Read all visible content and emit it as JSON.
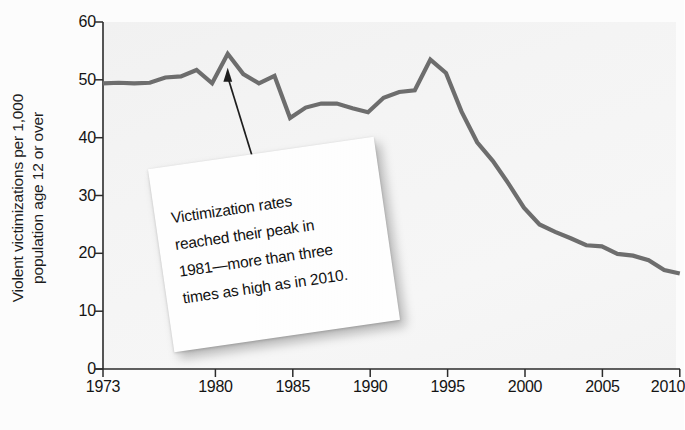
{
  "chart_data": {
    "type": "line",
    "title": "",
    "xlabel": "",
    "ylabel": "Violent victimizations per 1,000 population age 12 or over",
    "ylabel_line1": "Violent victimizations per 1,000",
    "ylabel_line2": "population age 12 or over",
    "xlim": [
      1973,
      2010
    ],
    "ylim": [
      0,
      60
    ],
    "grid": false,
    "legend": null,
    "line_color": "#6e6e6e",
    "x_ticks": [
      "1973",
      "1980",
      "1985",
      "1990",
      "1995",
      "2000",
      "2005",
      "2010"
    ],
    "x_tick_values": [
      1973,
      1980,
      1985,
      1990,
      1995,
      2000,
      2005,
      2010
    ],
    "y_ticks": [
      "0",
      "10",
      "20",
      "30",
      "40",
      "50",
      "60"
    ],
    "y_tick_values": [
      0,
      10,
      20,
      30,
      40,
      50,
      60
    ],
    "x": [
      1973,
      1974,
      1975,
      1976,
      1977,
      1978,
      1979,
      1980,
      1981,
      1982,
      1983,
      1984,
      1985,
      1986,
      1987,
      1988,
      1989,
      1990,
      1991,
      1992,
      1993,
      1994,
      1995,
      1996,
      1997,
      1998,
      1999,
      2000,
      2001,
      2002,
      2003,
      2004,
      2005,
      2006,
      2007,
      2008,
      2009,
      2010
    ],
    "values": [
      49.4,
      49.5,
      49.4,
      49.5,
      50.4,
      50.6,
      51.7,
      49.4,
      54.5,
      51.0,
      49.4,
      50.7,
      43.4,
      45.2,
      45.9,
      45.9,
      45.1,
      44.4,
      46.9,
      47.9,
      48.2,
      53.5,
      51.2,
      44.5,
      39.2,
      36.0,
      32.1,
      27.9,
      25.0,
      23.7,
      22.6,
      21.4,
      21.2,
      19.9,
      19.6,
      18.8,
      17.1,
      16.5
    ],
    "annotations": [
      {
        "text": "Victimization rates reached their peak in 1981—more than three times as high as in 2010.",
        "line1": "Victimization rates",
        "line2": "reached their peak in",
        "line3": "1981—more than three",
        "line4": "times as high as in 2010.",
        "points_to_year": 1981,
        "points_to_value": 54.5
      }
    ]
  }
}
